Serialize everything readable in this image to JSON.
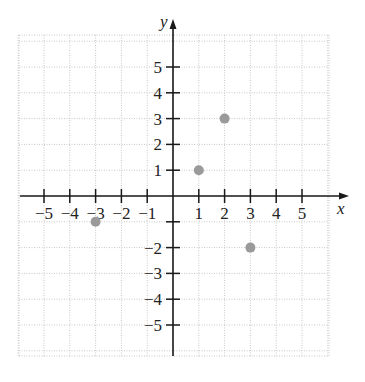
{
  "chart_data": {
    "type": "scatter",
    "title": "",
    "xlabel": "x",
    "ylabel": "y",
    "xlim": [
      -6,
      6
    ],
    "ylim": [
      -6,
      6
    ],
    "grid": true,
    "grid_style": "dotted",
    "x_ticks": [
      -5,
      -4,
      -3,
      -2,
      -1,
      1,
      2,
      3,
      4,
      5
    ],
    "y_ticks": [
      -5,
      -4,
      -3,
      -2,
      1,
      2,
      3,
      4,
      5
    ],
    "x_tick_labels": [
      "−5",
      "−4",
      "−3",
      "−2",
      "−1",
      "1",
      "2",
      "3",
      "4",
      "5"
    ],
    "y_tick_labels": [
      "−5",
      "−4",
      "−3",
      "−2",
      "1",
      "2",
      "3",
      "4",
      "5"
    ],
    "points": [
      {
        "x": 1,
        "y": 1
      },
      {
        "x": 2,
        "y": 3
      },
      {
        "x": -3,
        "y": -1
      },
      {
        "x": 3,
        "y": -2
      }
    ],
    "point_color": "#9a9a9a",
    "legend": null
  }
}
